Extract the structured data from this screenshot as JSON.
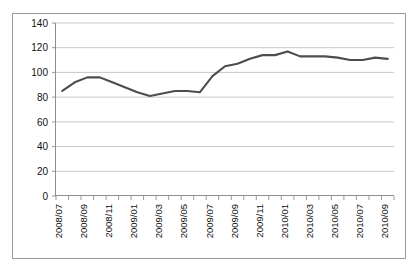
{
  "chart_data": {
    "type": "line",
    "title": "",
    "xlabel": "",
    "ylabel": "",
    "ylim": [
      0,
      140
    ],
    "ytick_values": [
      0,
      20,
      40,
      60,
      80,
      100,
      120,
      140
    ],
    "ytick_labels": [
      "0",
      "20",
      "40",
      "60",
      "80",
      "100",
      "120",
      "140"
    ],
    "grid": true,
    "legend": false,
    "legend_position": "none",
    "x_tick_rotation": 90,
    "x_tick_label_step": 2,
    "categories": [
      "2008/07",
      "2008/08",
      "2008/09",
      "2008/10",
      "2008/11",
      "2008/12",
      "2009/01",
      "2009/02",
      "2009/03",
      "2009/04",
      "2009/05",
      "2009/06",
      "2009/07",
      "2009/08",
      "2009/09",
      "2009/10",
      "2009/11",
      "2009/12",
      "2010/01",
      "2010/02",
      "2010/03",
      "2010/04",
      "2010/05",
      "2010/06",
      "2010/07",
      "2010/08",
      "2010/09"
    ],
    "visible_xtick_labels": [
      "2008/07",
      "2008/09",
      "2008/11",
      "2009/01",
      "2009/03",
      "2009/05",
      "2009/07",
      "2009/09",
      "2009/11",
      "2010/01",
      "2010/03",
      "2010/05",
      "2010/07",
      "2010/09"
    ],
    "series": [
      {
        "name": "index",
        "color": "#4d4d4d",
        "values": [
          85,
          92,
          96,
          96,
          92,
          88,
          84,
          81,
          83,
          85,
          85,
          84,
          97,
          105,
          107,
          111,
          114,
          114,
          117,
          113,
          113,
          113,
          112,
          110,
          110,
          112,
          111
        ]
      }
    ]
  },
  "colors": {
    "line": "#4d4d4d",
    "grid": "#b9b9b9",
    "axis": "#8d8d8d",
    "frame": "#9a9a9a",
    "text": "#111111",
    "background": "#ffffff"
  }
}
